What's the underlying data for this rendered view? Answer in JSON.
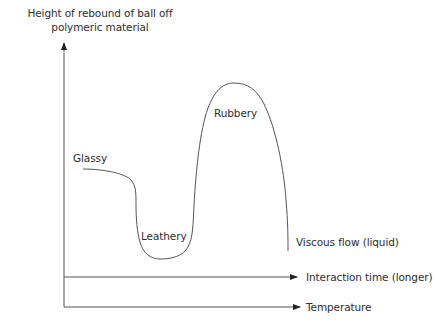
{
  "diagram": {
    "y_axis_title": {
      "line1": "Height of rebound of ball off",
      "line2": "polymeric material"
    },
    "x_axes": [
      {
        "label": "Interaction time (longer)"
      },
      {
        "label": "Temperature"
      }
    ],
    "regions": [
      {
        "label": "Glassy"
      },
      {
        "label": "Leathery"
      },
      {
        "label": "Rubbery"
      },
      {
        "label": "Viscous flow (liquid)"
      }
    ],
    "colors": {
      "line": "#555555",
      "text": "#2e2e2e",
      "background": "#ffffff"
    }
  }
}
